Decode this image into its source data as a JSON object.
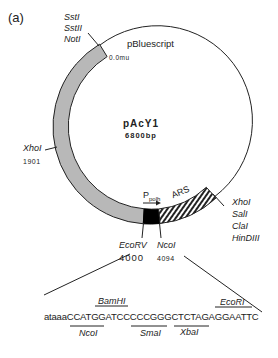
{
  "figure": {
    "panel_label": "(a)",
    "plasmid": {
      "name": "pAcY1",
      "size": "6800bp",
      "backbone_label": "pBluescript",
      "origin_label": "0.0mu"
    },
    "sites": {
      "top_left": [
        "SstI",
        "SstII",
        "NotI"
      ],
      "left": {
        "name": "XhoI",
        "position": "1901"
      },
      "bottom_left": {
        "name": "EcoRV",
        "position": "4000"
      },
      "bottom_mid": {
        "name": "NcoI",
        "position": "4094"
      },
      "right": [
        "XhoI",
        "SalI",
        "ClaI",
        "HinDIII"
      ]
    },
    "features": {
      "promoter": {
        "label_main": "P",
        "label_sub": "polh"
      },
      "ars": "ARS"
    },
    "sequence": {
      "prefix": "ataaa",
      "text": "CCATGGATCCCCCGGGCTCTAGAGGAATTC",
      "above": [
        {
          "name": "BamHI"
        },
        {
          "name": "EcoRI"
        }
      ],
      "below": [
        {
          "name": "NcoI"
        },
        {
          "name": "SmaI"
        },
        {
          "name": "XbaI"
        }
      ]
    },
    "colors": {
      "insert_band": "#b8b8b8",
      "promoter_block": "#000000",
      "line": "#222222"
    }
  }
}
